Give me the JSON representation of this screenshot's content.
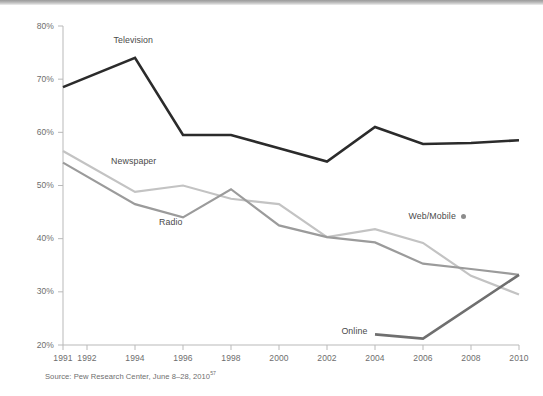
{
  "chart_data": {
    "type": "line",
    "title": "",
    "subtitle": "",
    "xlabel": "",
    "ylabel": "",
    "xlim": [
      1991,
      2010
    ],
    "ylim": [
      20,
      80
    ],
    "grid": false,
    "legend_position": "inline-labels",
    "x_tick_labels": [
      "1991",
      "1992",
      "1994",
      "1996",
      "1998",
      "2000",
      "2002",
      "2004",
      "2006",
      "2008",
      "2010"
    ],
    "x_tick_values": [
      1991,
      1992,
      1994,
      1996,
      1998,
      2000,
      2002,
      2004,
      2006,
      2008,
      2010
    ],
    "y_tick_labels": [
      "20%",
      "30%",
      "40%",
      "50%",
      "60%",
      "70%",
      "80%"
    ],
    "y_tick_values": [
      20,
      30,
      40,
      50,
      60,
      70,
      80
    ],
    "series": [
      {
        "name": "Television",
        "color": "#2b2b2b",
        "x": [
          1991,
          1994,
          1996,
          1998,
          2000,
          2002,
          2004,
          2006,
          2008,
          2010
        ],
        "values": [
          68.5,
          74.0,
          59.5,
          59.5,
          57.0,
          54.5,
          61.0,
          57.8,
          58.0,
          58.5
        ],
        "label_x": 1993.1,
        "label_y": 77.2
      },
      {
        "name": "Newspaper",
        "color": "#c3c3c3",
        "x": [
          1991,
          1994,
          1996,
          1998,
          2000,
          2002,
          2004,
          2006,
          2008,
          2010
        ],
        "values": [
          56.5,
          48.8,
          50.0,
          47.5,
          46.5,
          40.3,
          41.8,
          39.2,
          33.0,
          29.5
        ],
        "label_x": 1993.0,
        "label_y": 54.5
      },
      {
        "name": "Radio",
        "color": "#9b9b9b",
        "x": [
          1991,
          1994,
          1996,
          1998,
          2000,
          2002,
          2004,
          2006,
          2008,
          2010
        ],
        "values": [
          54.3,
          46.5,
          44.0,
          49.3,
          42.5,
          40.3,
          39.3,
          35.3,
          34.3,
          33.2
        ],
        "label_x": 1995.0,
        "label_y": 43.0
      },
      {
        "name": "Online",
        "color": "#6f6f6f",
        "x": [
          2004,
          2006,
          2010
        ],
        "values": [
          22.0,
          21.2,
          33.2
        ],
        "label_x": 2002.6,
        "label_y": 22.4
      }
    ],
    "legend_markers": [
      {
        "name": "Web/Mobile",
        "color": "#8c8c8c",
        "marker": "dot"
      }
    ],
    "source": "Source: Pew Research Center, June 8–28, 2010",
    "source_footnote": "57"
  },
  "axis": {
    "y_label_suffix": "%"
  }
}
